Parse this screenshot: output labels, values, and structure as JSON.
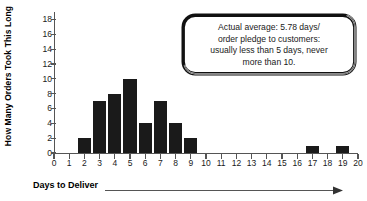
{
  "chart_data": {
    "type": "bar",
    "title": "",
    "subtitle": "",
    "xlabel": "Days to Deliver",
    "ylabel": "How Many Orders Took This Long",
    "xlim": [
      0,
      20
    ],
    "ylim": [
      0,
      19
    ],
    "grid": false,
    "legend_position": "none",
    "bar_color": "#1a1a1a",
    "axis_color": "#555555",
    "x_ticks": [
      0,
      1,
      2,
      3,
      4,
      5,
      6,
      7,
      8,
      9,
      10,
      11,
      12,
      13,
      14,
      15,
      16,
      17,
      18,
      19,
      20
    ],
    "y_ticks": [
      0,
      2,
      4,
      6,
      8,
      10,
      12,
      14,
      16,
      18
    ],
    "categories": [
      0,
      1,
      2,
      3,
      4,
      5,
      6,
      7,
      8,
      9,
      10,
      11,
      12,
      13,
      14,
      15,
      16,
      17,
      18,
      19,
      20
    ],
    "values": [
      0,
      0,
      2,
      7,
      8,
      10,
      4,
      7,
      4,
      2,
      0,
      0,
      0,
      0,
      0,
      0,
      0,
      1,
      0,
      1,
      0
    ],
    "annotations": [
      {
        "name": "average-callout",
        "lines": [
          "Actual average: 5.78 days/",
          "order pledge to customers:",
          "usually less than 5 days, never",
          "more than 10."
        ]
      }
    ]
  },
  "axes": {
    "x_title": "Days to Deliver",
    "y_title": "How Many Orders Took This Long"
  },
  "callout": {
    "line1": "Actual average: 5.78 days/",
    "line2": "order pledge to customers:",
    "line3": "usually less than 5 days, never",
    "line4": "more than 10."
  }
}
